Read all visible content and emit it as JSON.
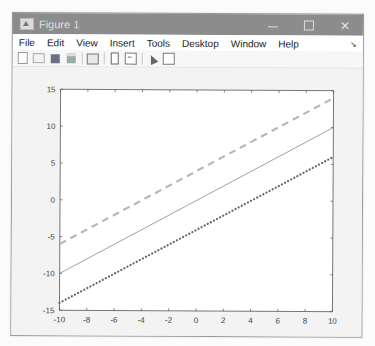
{
  "window": {
    "title": "Figure 1",
    "controls": {
      "minimize": "—",
      "maximize": "☐",
      "close": "✕"
    }
  },
  "menubar": {
    "items": [
      "File",
      "Edit",
      "View",
      "Insert",
      "Tools",
      "Desktop",
      "Window",
      "Help"
    ],
    "dock_arrow": "↘"
  },
  "toolbar": {
    "buttons": [
      {
        "name": "new-figure-icon"
      },
      {
        "name": "open-file-icon"
      },
      {
        "name": "save-icon"
      },
      {
        "name": "print-icon"
      },
      {
        "name": "link-plot-icon"
      },
      {
        "name": "colorbar-icon"
      },
      {
        "name": "legend-icon"
      },
      {
        "name": "edit-plot-arrow-icon"
      },
      {
        "name": "property-inspector-icon"
      }
    ]
  },
  "colors": {
    "axes": "#555555",
    "solid_line": "#8a8a8a",
    "dashed_line": "#b8b8b8",
    "dotted_line": "#666666",
    "axes_background": "#ffffff",
    "figure_background": "#f3f3f3"
  },
  "chart_data": {
    "type": "line",
    "title": "",
    "xlabel": "",
    "ylabel": "",
    "xlim": [
      -10,
      10
    ],
    "ylim": [
      -15,
      15
    ],
    "grid": false,
    "legend": null,
    "x_ticks": [
      -10,
      -8,
      -6,
      -4,
      -2,
      0,
      2,
      4,
      6,
      8,
      10
    ],
    "y_ticks": [
      -15,
      -10,
      -5,
      0,
      5,
      10,
      15
    ],
    "x": [
      -10,
      10
    ],
    "series": [
      {
        "name": "y = x",
        "style": "solid",
        "color": "#8a8a8a",
        "width": 0.8,
        "values": [
          -10,
          10
        ]
      },
      {
        "name": "y = x + 4",
        "style": "dashed",
        "color": "#b8b8b8",
        "width": 2.2,
        "values": [
          -6,
          14
        ]
      },
      {
        "name": "y = x - 4",
        "style": "dotted",
        "color": "#666666",
        "width": 2.2,
        "values": [
          -14,
          6
        ]
      }
    ]
  }
}
